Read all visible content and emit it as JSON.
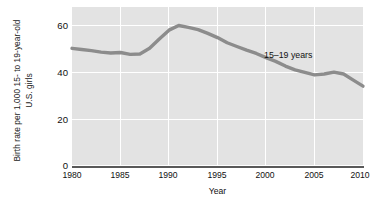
{
  "chart_data": {
    "type": "line",
    "title": "",
    "xlabel": "Year",
    "ylabel_lines": [
      "Birth rate per 1,000 15- to 19-year-old",
      "U.S. girls"
    ],
    "ylabel": "Birth rate per 1,000 15- to 19-year-old U.S. girls",
    "xlim": [
      1980,
      2010
    ],
    "ylim": [
      0,
      65
    ],
    "xticks": [
      1980,
      1985,
      1990,
      1995,
      2000,
      2005,
      2010
    ],
    "xtick_labels": [
      "1980",
      "1985",
      "1990",
      "1995",
      "2000",
      "2005",
      "2010"
    ],
    "yticks": [
      0,
      20,
      40,
      60
    ],
    "ytick_labels": [
      "0",
      "20",
      "40",
      "60"
    ],
    "grid": "white gridlines on gray panel, horizontal at 0/20/40/60, vertical at each 5-year tick",
    "legend_position": "inline annotation at right of line",
    "series": [
      {
        "name": "15–19 years",
        "annotation": "15–19 years",
        "color": "#8c8c8c",
        "x": [
          1980,
          1981,
          1982,
          1983,
          1984,
          1985,
          1986,
          1987,
          1988,
          1989,
          1990,
          1991,
          1992,
          1993,
          1994,
          1995,
          1996,
          1997,
          1998,
          1999,
          2000,
          2001,
          2002,
          2003,
          2004,
          2005,
          2006,
          2007,
          2008,
          2009,
          2010
        ],
        "values": [
          50.0,
          49.5,
          49.0,
          48.4,
          48.0,
          48.2,
          47.4,
          47.6,
          50.0,
          54.0,
          57.8,
          59.8,
          59.0,
          58.0,
          56.4,
          54.6,
          52.4,
          50.8,
          49.2,
          47.8,
          46.0,
          44.4,
          42.4,
          40.8,
          39.7,
          38.6,
          39.0,
          39.8,
          39.0,
          36.4,
          33.8
        ]
      }
    ]
  },
  "axes": {
    "x_title": "Year",
    "y_title_line1": "Birth rate per 1,000 15- to 19-year-old",
    "y_title_line2": "U.S. girls"
  },
  "style": {
    "panel_background": "#e3e3e3",
    "gridline_color": "#ffffff",
    "axis_color": "#595959",
    "line_color": "#8c8c8c",
    "text_color": "#111111"
  }
}
